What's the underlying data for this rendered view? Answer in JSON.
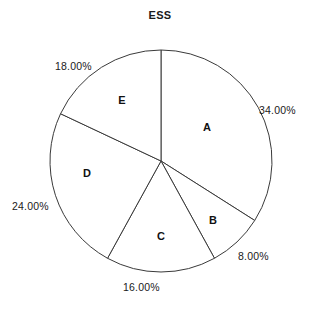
{
  "chart": {
    "title": "ESS"
  },
  "chart_data": {
    "type": "pie",
    "title": "ESS",
    "xlabel": "",
    "ylabel": "",
    "grid": false,
    "legend": "none",
    "labels_inside": "category letter",
    "labels_outside": "percentage",
    "start_angle_deg": 90,
    "direction": "clockwise",
    "categories": [
      "A",
      "B",
      "C",
      "D",
      "E"
    ],
    "values": [
      34,
      8,
      16,
      24,
      18
    ],
    "percent_labels": [
      "34.00%",
      "8.00%",
      "16.00%",
      "24.00%",
      "18.00%"
    ],
    "colors": {
      "slice_fill": "#ffffff",
      "outline": "#3a3a3a",
      "text": "#1a1a1a",
      "background": "#ffffff"
    },
    "slices": [
      {
        "label": "A",
        "value": 34,
        "percent": "34.00%"
      },
      {
        "label": "B",
        "value": 8,
        "percent": "8.00%"
      },
      {
        "label": "C",
        "value": 16,
        "percent": "16.00%"
      },
      {
        "label": "D",
        "value": 24,
        "percent": "24.00%"
      },
      {
        "label": "E",
        "value": 18,
        "percent": "18.00%"
      }
    ]
  },
  "labels": {
    "a_letter": "A",
    "b_letter": "B",
    "c_letter": "C",
    "d_letter": "D",
    "e_letter": "E",
    "a_pct": "34.00%",
    "b_pct": "8.00%",
    "c_pct": "16.00%",
    "d_pct": "24.00%",
    "e_pct": "18.00%"
  }
}
